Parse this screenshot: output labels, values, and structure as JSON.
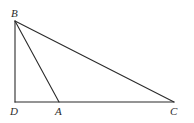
{
  "diagram": {
    "type": "geometry-triangle",
    "points": {
      "B": {
        "label": "B",
        "x": 15,
        "y": 21,
        "lx": 11,
        "ly": 17
      },
      "D": {
        "label": "D",
        "x": 15,
        "y": 102,
        "lx": 10,
        "ly": 115
      },
      "A": {
        "label": "A",
        "x": 59,
        "y": 102,
        "lx": 55,
        "ly": 115
      },
      "C": {
        "label": "C",
        "x": 174,
        "y": 102,
        "lx": 170,
        "ly": 115
      }
    },
    "segments": [
      [
        "B",
        "D"
      ],
      [
        "D",
        "C"
      ],
      [
        "B",
        "C"
      ],
      [
        "B",
        "A"
      ]
    ],
    "stroke_color": "#2b2b2b"
  }
}
